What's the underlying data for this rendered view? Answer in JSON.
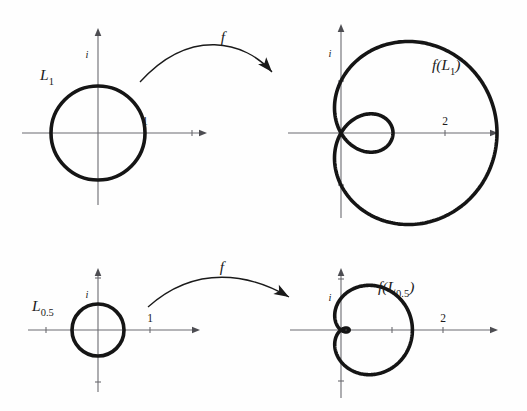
{
  "figure": {
    "background_color": "#fefefe",
    "curve_color": "#151515",
    "axis_color": "#6b6b70",
    "arrow_color": "#1a1a1a",
    "width": 527,
    "height": 411
  },
  "panels": [
    {
      "id": "domain-top",
      "role": "domain",
      "curve_label_main": "L",
      "curve_label_sub": "1",
      "origin": [
        98,
        133
      ],
      "unit_px": 47,
      "axis_x_range": [
        22,
        207
      ],
      "axis_y_range": [
        28,
        205
      ],
      "imaginary_tick_label": "i",
      "real_tick_label": "1",
      "real_tick_value": 1,
      "shape": {
        "type": "circle",
        "radius": 1,
        "center": [
          0,
          0
        ]
      }
    },
    {
      "id": "image-top",
      "role": "image",
      "curve_label_main": "f(L",
      "curve_label_sub": "1",
      "curve_label_tail": ")",
      "origin": [
        341,
        133
      ],
      "unit_px": 52,
      "axis_x_range": [
        288,
        498
      ],
      "axis_y_range": [
        24,
        218
      ],
      "imaginary_tick_label": "i",
      "real_tick_label": "2",
      "real_tick_value": 2,
      "shape": {
        "type": "limacon",
        "equation": "r = 1 + 2 cos(theta)",
        "a": 1,
        "b": 2,
        "has_inner_loop": true,
        "max_real": 3
      }
    },
    {
      "id": "domain-bottom",
      "role": "domain",
      "curve_label_main": "L",
      "curve_label_sub": "0.5",
      "origin": [
        98,
        330
      ],
      "unit_px": 52,
      "axis_x_range": [
        28,
        200
      ],
      "axis_y_range": [
        268,
        392
      ],
      "imaginary_tick_label": "i",
      "real_tick_label": "1",
      "real_tick_value": 1,
      "shape": {
        "type": "circle",
        "radius": 0.5,
        "center": [
          0,
          0
        ]
      }
    },
    {
      "id": "image-bottom",
      "role": "image",
      "curve_label_main": "f(L",
      "curve_label_sub": "0.5",
      "curve_label_tail": ")",
      "origin": [
        341,
        330
      ],
      "unit_px": 51,
      "axis_x_range": [
        290,
        498
      ],
      "axis_y_range": [
        268,
        398
      ],
      "imaginary_tick_label": "i",
      "real_tick_label": "2",
      "real_tick_value": 2,
      "shape": {
        "type": "limacon",
        "equation": "r = 0.25 + cos(theta) dimpled",
        "a": 0.62,
        "b": 0.78,
        "has_inner_loop": false,
        "max_real": 1.4
      }
    }
  ],
  "map_arrows": [
    {
      "id": "arrow-top",
      "label": "f",
      "label_pos": [
        223,
        42
      ],
      "start": [
        140,
        82
      ],
      "ctrl1": [
        190,
        27
      ],
      "ctrl2": [
        245,
        41
      ],
      "end": [
        272,
        72
      ]
    },
    {
      "id": "arrow-bottom",
      "label": "f",
      "label_pos": [
        222,
        272
      ],
      "start": [
        148,
        307
      ],
      "ctrl1": [
        196,
        264
      ],
      "ctrl2": [
        250,
        274
      ],
      "end": [
        289,
        297
      ]
    }
  ],
  "chart_data": {
    "type": "line",
    "xlabel": "Re",
    "ylabel": "Im",
    "grid": false,
    "legend": "none",
    "series": [
      {
        "name": "L_1",
        "kind": "circle",
        "radius": 1,
        "panel": "domain-top",
        "annotation": "L1"
      },
      {
        "name": "f(L_1)",
        "kind": "limacon",
        "polar": "r = 1 + 2 cos(theta)",
        "panel": "image-top",
        "annotation": "f(L1)",
        "x_extent": [
          -1,
          3
        ],
        "y_extent": [
          -1.8,
          1.8
        ]
      },
      {
        "name": "L_0.5",
        "kind": "circle",
        "radius": 0.5,
        "panel": "domain-bottom",
        "annotation": "L0.5"
      },
      {
        "name": "f(L_0.5)",
        "kind": "limacon",
        "polar": "r = 0.62 + 0.78 cos(theta)",
        "panel": "image-bottom",
        "annotation": "f(L0.5)",
        "x_extent": [
          -0.16,
          1.4
        ],
        "y_extent": [
          -0.75,
          0.75
        ]
      }
    ],
    "tick_labels": {
      "domain_top": [
        "i",
        "1"
      ],
      "image_top": [
        "i",
        "2"
      ],
      "domain_bottom": [
        "i",
        "1"
      ],
      "image_bottom": [
        "i",
        "2"
      ]
    }
  }
}
